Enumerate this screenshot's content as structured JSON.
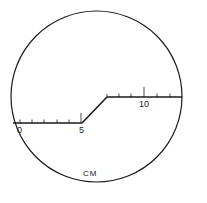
{
  "diagram": {
    "unit_label": "CM",
    "scale_labels": [
      {
        "text": "0",
        "x": 18,
        "y": 133
      },
      {
        "text": "5",
        "x": 80,
        "y": 133
      },
      {
        "text": "10",
        "x": 140,
        "y": 107
      }
    ],
    "colors": {
      "stroke": "#1a1a1a",
      "background": "#ffffff"
    }
  }
}
